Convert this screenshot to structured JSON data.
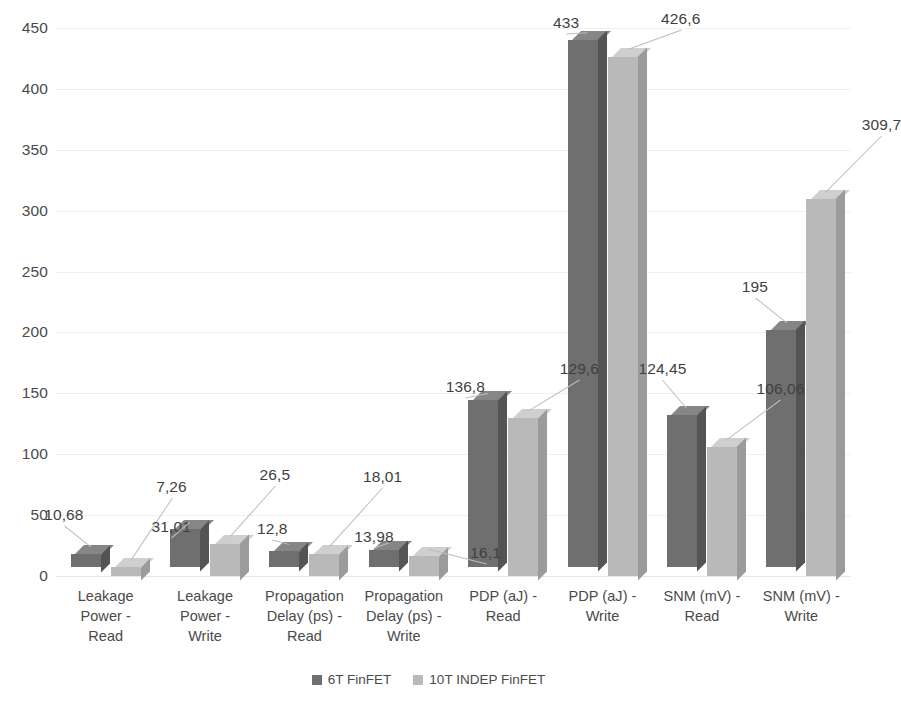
{
  "chart_data": {
    "type": "bar",
    "title": "",
    "subtitle": "",
    "xlabel": "",
    "ylabel": "",
    "ylim": [
      0,
      450
    ],
    "ytick_step": 50,
    "yticks": [
      "0",
      "50",
      "100",
      "150",
      "200",
      "250",
      "300",
      "350",
      "400",
      "450"
    ],
    "grid": true,
    "grid_axis": "y",
    "legend_position": "bottom",
    "three_d": true,
    "decimal_separator": ",",
    "categories": [
      "Leakage Power - Read",
      "Leakage Power - Write",
      "Propagation Delay (ps) - Read",
      "Propagation Delay (ps) - Write",
      "PDP (aJ) - Read",
      "PDP (aJ) - Write",
      "SNM (mV) - Read",
      "SNM (mV) - Write"
    ],
    "category_lines": [
      [
        "Leakage",
        "Power -",
        "Read"
      ],
      [
        "Leakage",
        "Power -",
        "Write"
      ],
      [
        "Propagation",
        "Delay (ps) -",
        "Read"
      ],
      [
        "Propagation",
        "Delay (ps) -",
        "Write"
      ],
      [
        "PDP (aJ) -",
        "Read"
      ],
      [
        "PDP (aJ) -",
        "Write"
      ],
      [
        "SNM (mV) -",
        "Read"
      ],
      [
        "SNM (mV) -",
        "Write"
      ]
    ],
    "series": [
      {
        "name": "6T FinFET",
        "color": "#6f6f6f",
        "values": [
          10.68,
          31.01,
          12.8,
          13.98,
          136.8,
          433,
          124.45,
          195
        ],
        "labels": [
          "10,68",
          "31,01",
          "12,8",
          "13,98",
          "136,8",
          "433",
          "124,45",
          "195"
        ]
      },
      {
        "name": "10T INDEP FinFET",
        "color": "#b9b9b9",
        "values": [
          7.26,
          26.5,
          18.01,
          16.1,
          129.6,
          426.6,
          106.06,
          309.7
        ],
        "labels": [
          "7,26",
          "26,5",
          "18,01",
          "16,1",
          "129,6",
          "426,6",
          "106,06",
          "309,7"
        ]
      }
    ]
  },
  "legend": {
    "items": [
      {
        "label": "6T FinFET",
        "color": "#6f6f6f"
      },
      {
        "label": "10T INDEP FinFET",
        "color": "#b9b9b9"
      }
    ]
  }
}
